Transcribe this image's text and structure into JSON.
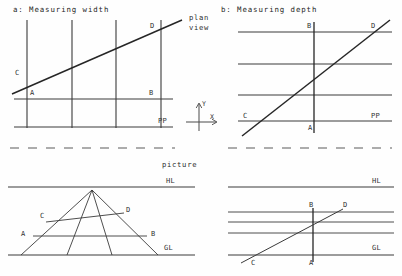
{
  "figure": {
    "kind": "perspective-construction-diagram",
    "ink_color": "#3a3a3a",
    "thick_ink_color": "#262626",
    "background": "#fefefe"
  },
  "panels": {
    "top_left": {
      "title": "a: Measuring width",
      "point_labels": [
        "C",
        "A",
        "B",
        "D"
      ],
      "line_labels": [
        "PP"
      ]
    },
    "top_right": {
      "title": "b: Measuring depth",
      "point_labels": [
        "B",
        "D",
        "C",
        "A"
      ],
      "line_labels": [
        "PP"
      ]
    },
    "bottom_left": {
      "point_labels": [
        "C",
        "D",
        "A",
        "B"
      ],
      "line_labels": [
        "HL",
        "GL"
      ]
    },
    "bottom_right": {
      "point_labels": [
        "B",
        "D",
        "C",
        "A"
      ],
      "line_labels": [
        "HL",
        "GL"
      ]
    }
  },
  "middle": {
    "plan_view_line1": "plan",
    "plan_view_line2": "view",
    "picture_label": "picture",
    "axis_y": "Y",
    "axis_x": "X"
  },
  "labels": {
    "C": "C",
    "A": "A",
    "B": "B",
    "D": "D",
    "PP": "PP",
    "HL": "HL",
    "GL": "GL"
  }
}
